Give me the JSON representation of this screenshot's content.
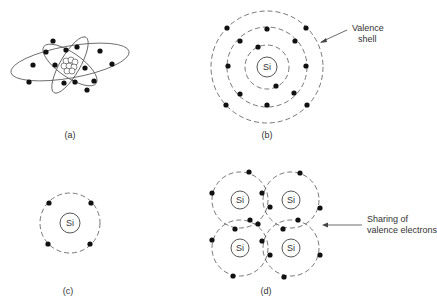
{
  "figure": {
    "panels": [
      {
        "id": "a",
        "label": "(a)",
        "description": "Bohr model of silicon atom with nucleus and orbiting electrons"
      },
      {
        "id": "b",
        "label": "(b)",
        "nucleus": "Si",
        "shells": [
          2,
          8,
          4
        ],
        "annotation": "Valence\nshell",
        "annotation_line1": "Valence",
        "annotation_line2": "shell"
      },
      {
        "id": "c",
        "label": "(c)",
        "nucleus": "Si",
        "valence_electrons": 4
      },
      {
        "id": "d",
        "label": "(d)",
        "nuclei": [
          "Si",
          "Si",
          "Si",
          "Si"
        ],
        "annotation_line1": "Sharing of",
        "annotation_line2": "valence electrons"
      }
    ],
    "colors": {
      "line": "#555555",
      "electron": "#111111",
      "background": "#ffffff"
    }
  }
}
